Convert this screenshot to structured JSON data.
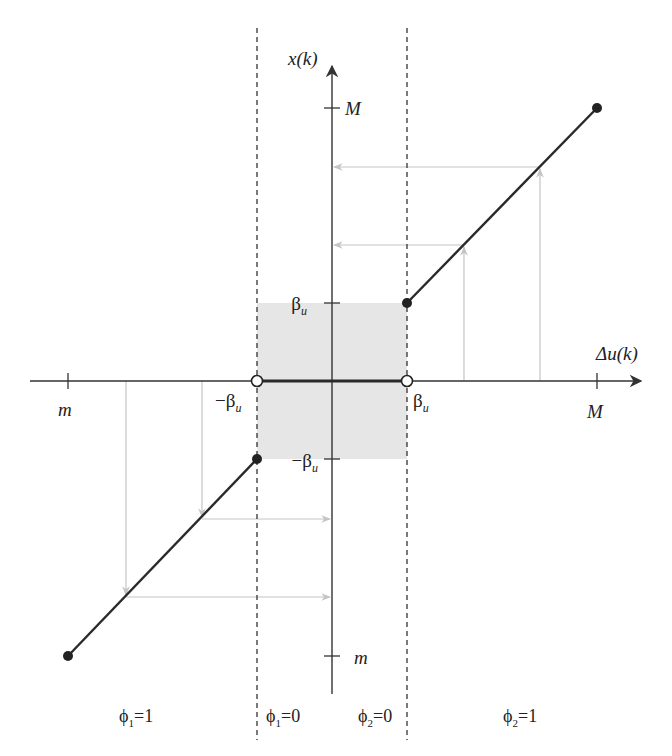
{
  "diagram": {
    "type": "dead-zone quantizer mapping",
    "colors": {
      "axis": "#333333",
      "curve": "#2a2a2a",
      "guide": "#bdbdbd",
      "deadzone_fill": "#e6e6e6",
      "dashed": "#333333"
    },
    "axes": {
      "x_label": "Δu(k)",
      "y_label": "x(k)"
    },
    "ticks": {
      "x_min": "m",
      "x_max": "M",
      "x_neg_beta": "−β",
      "x_pos_beta": "β",
      "y_max": "M",
      "y_min": "m",
      "y_pos_beta": "β",
      "y_neg_beta": "−β",
      "beta_sub": "u"
    },
    "regions": [
      {
        "phi": "ϕ",
        "sub": "1",
        "eq": "=1"
      },
      {
        "phi": "ϕ",
        "sub": "1",
        "eq": "=0"
      },
      {
        "phi": "ϕ",
        "sub": "2",
        "eq": "=0"
      },
      {
        "phi": "ϕ",
        "sub": "2",
        "eq": "=1"
      }
    ],
    "segments": [
      {
        "from": [
          "m",
          "m"
        ],
        "to": [
          "-β_u",
          "-β_u"
        ],
        "endpoints": "filled"
      },
      {
        "from": [
          "-β_u",
          "0"
        ],
        "to": [
          "β_u",
          "0"
        ],
        "endpoints": "open"
      },
      {
        "from": [
          "β_u",
          "β_u"
        ],
        "to": [
          "M",
          "M"
        ],
        "endpoints": "filled"
      }
    ]
  }
}
